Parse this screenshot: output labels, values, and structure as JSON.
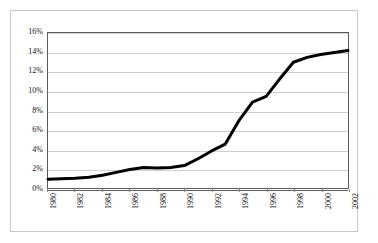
{
  "chart_data": {
    "type": "line",
    "title": "",
    "subtitle": "",
    "xlabel": "",
    "ylabel": "",
    "grid": true,
    "legend": false,
    "legend_position": "none",
    "xlim": [
      1980,
      2002
    ],
    "ylim": [
      0,
      16
    ],
    "y_unit": "%",
    "y_tick_labels": [
      "0%",
      "2%",
      "4%",
      "6%",
      "8%",
      "10%",
      "12%",
      "14%",
      "16%"
    ],
    "y_ticks": [
      0,
      2,
      4,
      6,
      8,
      10,
      12,
      14,
      16
    ],
    "x_tick_labels": [
      "1980",
      "1982",
      "1984",
      "1986",
      "1988",
      "1990",
      "1992",
      "1994",
      "1996",
      "1998",
      "2000",
      "2002"
    ],
    "x_ticks": [
      1980,
      1982,
      1984,
      1986,
      1988,
      1990,
      1992,
      1994,
      1996,
      1998,
      2000,
      2002
    ],
    "line_color": "#000000",
    "line_width": 3,
    "plot_background": "#ffffff",
    "grid_color": "#d0d0d0",
    "axis_color": "#5a5a5a",
    "x": [
      1980,
      1981,
      1982,
      1983,
      1984,
      1985,
      1986,
      1987,
      1988,
      1989,
      1990,
      1991,
      1992,
      1993,
      1994,
      1995,
      1996,
      1997,
      1998,
      1999,
      2000,
      2001,
      2002
    ],
    "values": [
      1.0,
      1.05,
      1.1,
      1.2,
      1.4,
      1.7,
      2.0,
      2.2,
      2.15,
      2.2,
      2.4,
      3.1,
      3.9,
      4.6,
      7.0,
      8.9,
      9.5,
      11.3,
      13.0,
      13.5,
      13.8,
      14.0,
      14.2
    ],
    "series": [
      {
        "name": "",
        "values": [
          1.0,
          1.05,
          1.1,
          1.2,
          1.4,
          1.7,
          2.0,
          2.2,
          2.15,
          2.2,
          2.4,
          3.1,
          3.9,
          4.6,
          7.0,
          8.9,
          9.5,
          11.3,
          13.0,
          13.5,
          13.8,
          14.0,
          14.2
        ]
      }
    ]
  }
}
